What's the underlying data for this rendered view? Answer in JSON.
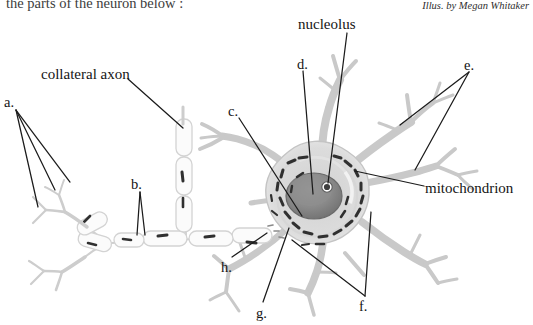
{
  "page": {
    "width": 533,
    "height": 325,
    "background": "#ffffff",
    "ink": "#141414"
  },
  "prompt": {
    "text": "the parts of the neuron below :",
    "note": "clipped top line of question stem"
  },
  "credit": {
    "text": "Illus. by Megan Whitaker"
  },
  "figure": {
    "subject": "neuron",
    "art_color": "#b9b9b9",
    "organelle_color": "#3a3a3a",
    "nucleus_color": "#8d8d8d",
    "nucleolus_color": "#4a4a4a",
    "leader_color": "#181818"
  },
  "labels": [
    {
      "id": "nucleolus",
      "text": "nucleolus",
      "kind": "word",
      "x": 298,
      "y": 17
    },
    {
      "id": "collateral",
      "text": "collateral axon",
      "kind": "word",
      "x": 41,
      "y": 67
    },
    {
      "id": "mitochondrion",
      "text": "mitochondrion",
      "kind": "word",
      "x": 425,
      "y": 181
    },
    {
      "id": "a",
      "text": "a.",
      "kind": "letter",
      "x": 4,
      "y": 95
    },
    {
      "id": "b",
      "text": "b.",
      "kind": "letter",
      "x": 131,
      "y": 177
    },
    {
      "id": "c",
      "text": "c.",
      "kind": "letter",
      "x": 228,
      "y": 104
    },
    {
      "id": "d",
      "text": "d.",
      "kind": "letter",
      "x": 297,
      "y": 57
    },
    {
      "id": "e",
      "text": "e.",
      "kind": "letter",
      "x": 464,
      "y": 58
    },
    {
      "id": "f",
      "text": "f.",
      "kind": "letter",
      "x": 359,
      "y": 299
    },
    {
      "id": "g",
      "text": "g.",
      "kind": "letter",
      "x": 256,
      "y": 306
    },
    {
      "id": "h",
      "text": "h.",
      "kind": "letter",
      "x": 221,
      "y": 260
    }
  ],
  "label_text": {
    "nucleolus": "nucleolus",
    "collateral_axon": "collateral axon",
    "mitochondrion": "mitochondrion",
    "a": "a.",
    "b": "b.",
    "c": "c.",
    "d": "d.",
    "e": "e.",
    "f": "f.",
    "g": "g.",
    "h": "h."
  }
}
